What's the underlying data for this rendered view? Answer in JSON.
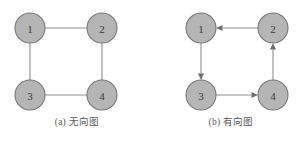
{
  "figure": {
    "background_color": "#ffffff",
    "node_fill_color": "#b5b5b5",
    "node_stroke_color": "#777777",
    "edge_color": "#8d8d8d",
    "arrow_color": "#6f6f6f",
    "label_color": "#3a3a3a",
    "caption_color": "#575757"
  },
  "panels": [
    {
      "id": "undirected",
      "caption": "(a) 无向图",
      "directed": false,
      "nodes": [
        {
          "id": "1",
          "label": "1",
          "cx": 30,
          "cy": 28,
          "r": 15
        },
        {
          "id": "2",
          "label": "2",
          "cx": 102,
          "cy": 28,
          "r": 15
        },
        {
          "id": "3",
          "label": "3",
          "cx": 30,
          "cy": 95,
          "r": 15
        },
        {
          "id": "4",
          "label": "4",
          "cx": 102,
          "cy": 95,
          "r": 15
        }
      ],
      "edges": [
        {
          "from": "1",
          "to": "2"
        },
        {
          "from": "1",
          "to": "3"
        },
        {
          "from": "3",
          "to": "4"
        },
        {
          "from": "2",
          "to": "4"
        }
      ]
    },
    {
      "id": "directed",
      "caption": "(b) 有向图",
      "directed": true,
      "nodes": [
        {
          "id": "1",
          "label": "1",
          "cx": 47,
          "cy": 28,
          "r": 15
        },
        {
          "id": "2",
          "label": "2",
          "cx": 119,
          "cy": 28,
          "r": 15
        },
        {
          "id": "3",
          "label": "3",
          "cx": 47,
          "cy": 95,
          "r": 15
        },
        {
          "id": "4",
          "label": "4",
          "cx": 119,
          "cy": 95,
          "r": 15
        }
      ],
      "edges": [
        {
          "from": "2",
          "to": "1"
        },
        {
          "from": "1",
          "to": "3"
        },
        {
          "from": "3",
          "to": "4"
        },
        {
          "from": "4",
          "to": "2"
        }
      ]
    }
  ]
}
